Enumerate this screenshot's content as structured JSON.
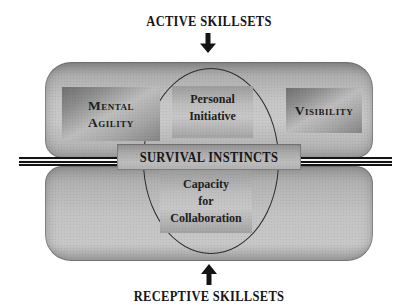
{
  "header": {
    "title": "ACTIVE SKILLSETS"
  },
  "footer": {
    "title": "RECEPTIVE SKILLSETS"
  },
  "core": {
    "bar_label": "SURVIVAL INSTINCTS",
    "boxes": {
      "mental_agility": {
        "line1": "Mental",
        "line2": "Agility"
      },
      "personal_initiative": {
        "line1": "Personal",
        "line2": "Initiative"
      },
      "visibility": {
        "label": "Visibility"
      },
      "capacity_for_collaboration": {
        "line1": "Capacity",
        "line2": "for",
        "line3": "Collaboration"
      }
    }
  },
  "icons": {
    "top_arrow": "arrow-down-icon",
    "bottom_arrow": "arrow-up-icon"
  },
  "colors": {
    "background": "#ffffff",
    "panel_dark": "#8d8d8d",
    "panel_light": "#c9c9c9",
    "box_dark": "#6f6f6f",
    "box_light": "#c7c7c7",
    "text": "#1e1e1e",
    "line": "#141414"
  }
}
